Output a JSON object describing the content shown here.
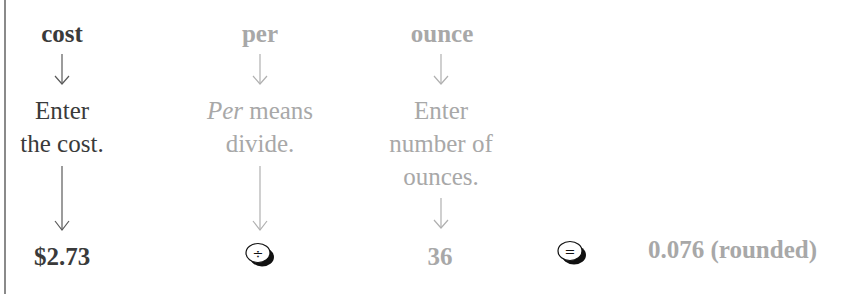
{
  "columns": [
    {
      "header": "cost",
      "instruction_line1": "Enter",
      "instruction_line2": "the cost.",
      "value": "$2.73",
      "tone": "dark"
    },
    {
      "header": "per",
      "instruction_italic": "Per",
      "instruction_rest": " means",
      "instruction_line2": "divide.",
      "key_symbol": "÷",
      "key_name": "divide-key",
      "tone": "light"
    },
    {
      "header": "ounce",
      "instruction_line1": "Enter",
      "instruction_line2": "number of",
      "instruction_line3": "ounces.",
      "value": "36",
      "tone": "light"
    }
  ],
  "equals_key_symbol": "=",
  "result": "0.076 (rounded)",
  "colors": {
    "dark_text": "#3a3a3a",
    "light_text": "#a8a8a8",
    "border": "#8a8a8a"
  }
}
